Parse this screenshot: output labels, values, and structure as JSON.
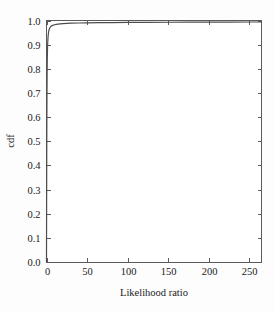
{
  "chart_data": {
    "type": "line",
    "title": "",
    "xlabel": "Likelihood ratio",
    "ylabel": "cdf",
    "xlim": [
      0,
      265
    ],
    "ylim": [
      0.0,
      1.0
    ],
    "grid": false,
    "legend": null,
    "xticks": [
      0,
      50,
      100,
      150,
      200,
      250
    ],
    "xtick_labels": [
      "0",
      "50",
      "100",
      "150",
      "200",
      "250"
    ],
    "yticks": [
      0.0,
      0.1,
      0.2,
      0.3,
      0.4,
      0.5,
      0.6,
      0.7,
      0.8,
      0.9,
      1.0
    ],
    "ytick_labels": [
      "0.0",
      "0.1",
      "0.2",
      "0.3",
      "0.4",
      "0.5",
      "0.6",
      "0.7",
      "0.8",
      "0.9",
      "1.0"
    ],
    "tick_direction": "in",
    "frame": "box",
    "series": [
      {
        "name": "cdf",
        "color": "#4d4d4d",
        "x": [
          0.0,
          0.2,
          0.4,
          0.6,
          0.8,
          1.0,
          1.3,
          1.6,
          2.0,
          2.5,
          3.0,
          3.6,
          4.2,
          5.0,
          6.0,
          7.0,
          8.5,
          10.0,
          12.0,
          14.0,
          17.0,
          20.0,
          25.0,
          30.0,
          40.0,
          50.0,
          65.0,
          80.0,
          100.0,
          125.0,
          150.0,
          175.0,
          200.0,
          225.0,
          250.0,
          265.0
        ],
        "y": [
          0.0,
          0.31,
          0.55,
          0.7,
          0.79,
          0.845,
          0.89,
          0.915,
          0.935,
          0.951,
          0.96,
          0.966,
          0.97,
          0.974,
          0.977,
          0.979,
          0.981,
          0.9825,
          0.984,
          0.985,
          0.9862,
          0.987,
          0.9881,
          0.9888,
          0.9897,
          0.9903,
          0.991,
          0.9915,
          0.992,
          0.9925,
          0.9928,
          0.9931,
          0.9933,
          0.9935,
          0.9937,
          0.9938
        ]
      }
    ]
  },
  "axes": {
    "x_title": "Likelihood ratio",
    "y_title": "cdf"
  },
  "colors": {
    "background": "#fdfdfd",
    "frame": "#5a5a5a",
    "curve": "#4d4d4d",
    "text": "#1a1a1a"
  }
}
